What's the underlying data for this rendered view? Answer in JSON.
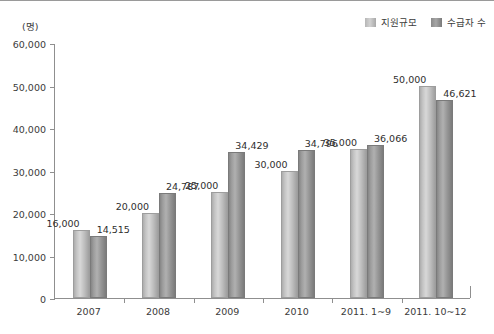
{
  "chart_data": {
    "type": "bar",
    "title": "",
    "xlabel": "",
    "ylabel": "(명)",
    "ylim": [
      0,
      60000
    ],
    "yticks": [
      0,
      10000,
      20000,
      30000,
      40000,
      50000,
      60000
    ],
    "ytick_labels": [
      "0",
      "10,000",
      "20,000",
      "30,000",
      "40,000",
      "50,000",
      "60,000"
    ],
    "grid": false,
    "legend_position": "top-right",
    "categories": [
      "2007",
      "2008",
      "2009",
      "2010",
      "2011. 1~9",
      "2011. 10~12"
    ],
    "series": [
      {
        "name": "지원규모",
        "color": "#c9c9c9",
        "values": [
          16000,
          20000,
          25000,
          30000,
          35000,
          50000
        ],
        "labels": [
          "16,000",
          "20,000",
          "25,000",
          "30,000",
          "35,000",
          "50,000"
        ]
      },
      {
        "name": "수급자 수",
        "color": "#969696",
        "values": [
          14515,
          24787,
          34429,
          34796,
          36066,
          46621
        ],
        "labels": [
          "14,515",
          "24,787",
          "34,429",
          "34,796",
          "36,066",
          "46,621"
        ]
      }
    ]
  },
  "legend": {
    "entries": [
      {
        "label": "지원규모"
      },
      {
        "label": "수급자 수"
      }
    ]
  },
  "axis": {
    "unit_label": "(명)"
  }
}
